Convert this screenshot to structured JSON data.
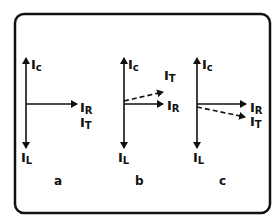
{
  "diagram": {
    "type": "phasor-diagrams",
    "panels": [
      {
        "id": "a",
        "caption": "a",
        "labels": {
          "Ic": {
            "main": "I",
            "sub": "c"
          },
          "IL": {
            "main": "I",
            "sub": "L"
          },
          "IR": {
            "main": "I",
            "sub": "R"
          },
          "IT": {
            "main": "I",
            "sub": "T"
          }
        },
        "note": "I_T coincides with I_R"
      },
      {
        "id": "b",
        "caption": "b",
        "labels": {
          "Ic": {
            "main": "I",
            "sub": "c"
          },
          "IL": {
            "main": "I",
            "sub": "L"
          },
          "IR": {
            "main": "I",
            "sub": "R"
          },
          "IT": {
            "main": "I",
            "sub": "T"
          }
        },
        "note": "I_T (dashed) leads above I_R"
      },
      {
        "id": "c",
        "caption": "c",
        "labels": {
          "Ic": {
            "main": "I",
            "sub": "c"
          },
          "IL": {
            "main": "I",
            "sub": "L"
          },
          "IR": {
            "main": "I",
            "sub": "R"
          },
          "IT": {
            "main": "I",
            "sub": "T"
          }
        },
        "note": "I_T (dashed) lags below I_R"
      }
    ],
    "colors": {
      "stroke": "#111111",
      "background": "#ffffff"
    }
  }
}
